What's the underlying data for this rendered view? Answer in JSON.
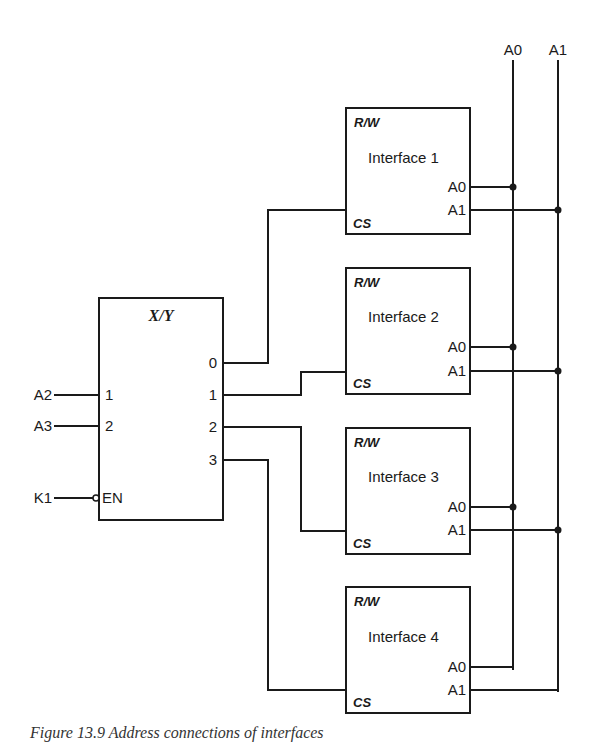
{
  "bus": {
    "a0_label": "A0",
    "a1_label": "A1"
  },
  "decoder": {
    "title": "X/Y",
    "inputs": [
      {
        "signal": "A2",
        "pin": "1"
      },
      {
        "signal": "A3",
        "pin": "2"
      }
    ],
    "enable": {
      "signal": "K1",
      "pin": "EN"
    },
    "outputs": [
      "0",
      "1",
      "2",
      "3"
    ]
  },
  "interfaces": [
    {
      "name": "Interface 1",
      "rw": "R/W",
      "cs": "CS",
      "a0": "A0",
      "a1": "A1"
    },
    {
      "name": "Interface 2",
      "rw": "R/W",
      "cs": "CS",
      "a0": "A0",
      "a1": "A1"
    },
    {
      "name": "Interface 3",
      "rw": "R/W",
      "cs": "CS",
      "a0": "A0",
      "a1": "A1"
    },
    {
      "name": "Interface 4",
      "rw": "R/W",
      "cs": "CS",
      "a0": "A0",
      "a1": "A1"
    }
  ],
  "caption": "Figure 13.9   Address connections of interfaces"
}
